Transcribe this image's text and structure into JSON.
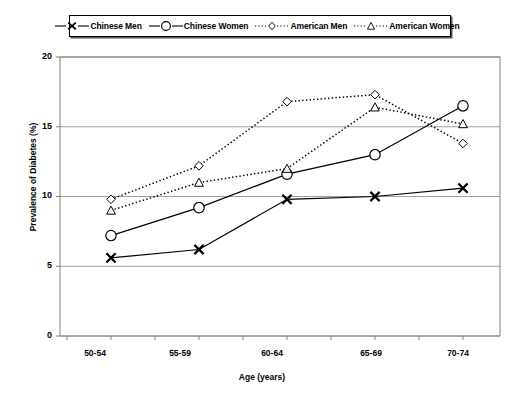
{
  "chart_data": {
    "type": "line",
    "title": "",
    "xlabel": "Age (years)",
    "ylabel": "Prevalence of Diabetes (%)",
    "categories": [
      "50-54",
      "55-59",
      "60-64",
      "65-69",
      "70-74"
    ],
    "ylim": [
      0,
      20
    ],
    "yticks": [
      0,
      5,
      10,
      15,
      20
    ],
    "grid": "horizontal",
    "legend_position": "top-center",
    "series": [
      {
        "name": "Chinese Men",
        "marker": "x-marker",
        "line_style": "solid",
        "color": "#000000",
        "values": [
          5.6,
          6.2,
          9.8,
          10.0,
          10.6
        ]
      },
      {
        "name": "Chinese Women",
        "marker": "circle-marker",
        "line_style": "solid",
        "color": "#000000",
        "values": [
          7.2,
          9.2,
          11.6,
          13.0,
          16.5
        ]
      },
      {
        "name": "American Men",
        "marker": "diamond-marker",
        "line_style": "dotted",
        "color": "#000000",
        "values": [
          9.8,
          12.2,
          16.8,
          17.3,
          13.8
        ]
      },
      {
        "name": "American Women",
        "marker": "triangle-marker",
        "line_style": "dotted",
        "color": "#000000",
        "values": [
          9.0,
          11.0,
          12.0,
          16.4,
          15.2
        ]
      }
    ]
  },
  "axis": {
    "y_tick_labels": [
      "20",
      "15",
      "10",
      "5",
      "0"
    ],
    "x_tick_labels": [
      "50-54",
      "55-59",
      "60-64",
      "65-69",
      "70-74"
    ],
    "y_title": "Prevalence of Diabetes (%)",
    "x_title": "Age (years)"
  },
  "legend": {
    "items": [
      {
        "label": "Chinese Men",
        "marker": "x-marker",
        "style": "solid"
      },
      {
        "label": "Chinese Women",
        "marker": "circle-marker",
        "style": "solid"
      },
      {
        "label": "American Men",
        "marker": "diamond-marker",
        "style": "dotted"
      },
      {
        "label": "American Women",
        "marker": "triangle-marker",
        "style": "dotted"
      }
    ]
  },
  "colors": {
    "plot_frame": "#808080",
    "gridline": "#a0a0a0",
    "series_line": "#000000",
    "background": "#ffffff"
  }
}
